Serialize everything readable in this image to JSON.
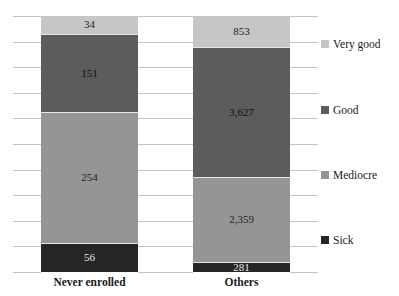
{
  "chart_data": {
    "type": "bar",
    "stacked": true,
    "title": "",
    "xlabel": "",
    "ylabel": "",
    "categories": [
      "Never enrolled",
      "Others"
    ],
    "series": [
      {
        "name": "Sick",
        "values": [
          56,
          281
        ],
        "color": "#262626",
        "label_color": "#e8e8e8"
      },
      {
        "name": "Mediocre",
        "values": [
          254,
          2359
        ],
        "color": "#959595",
        "label_color": "#222222"
      },
      {
        "name": "Good",
        "values": [
          151,
          3627
        ],
        "color": "#5c5c5c",
        "label_color": "#111111"
      },
      {
        "name": "Very good",
        "values": [
          34,
          853
        ],
        "color": "#c6c6c6",
        "label_color": "#222222"
      }
    ],
    "data_labels": {
      "Never enrolled": [
        "56",
        "254",
        "151",
        "34"
      ],
      "Others": [
        "281",
        "2,359",
        "3,627",
        "853"
      ]
    },
    "normalized_to_100_percent": true,
    "grid": true,
    "legend_position": "right",
    "legend_order": [
      "Very good",
      "Good",
      "Mediocre",
      "Sick"
    ]
  },
  "legend": [
    {
      "label": "Very good",
      "color": "#c6c6c6"
    },
    {
      "label": "Good",
      "color": "#5c5c5c"
    },
    {
      "label": "Mediocre",
      "color": "#959595"
    },
    {
      "label": "Sick",
      "color": "#262626"
    }
  ],
  "bars": [
    {
      "category": "Never enrolled",
      "segments": [
        {
          "name": "Very good",
          "label": "34"
        },
        {
          "name": "Good",
          "label": "151"
        },
        {
          "name": "Mediocre",
          "label": "254"
        },
        {
          "name": "Sick",
          "label": "56"
        }
      ]
    },
    {
      "category": "Others",
      "segments": [
        {
          "name": "Very good",
          "label": "853"
        },
        {
          "name": "Good",
          "label": "3,627"
        },
        {
          "name": "Mediocre",
          "label": "2,359"
        },
        {
          "name": "Sick",
          "label": "281"
        }
      ]
    }
  ]
}
